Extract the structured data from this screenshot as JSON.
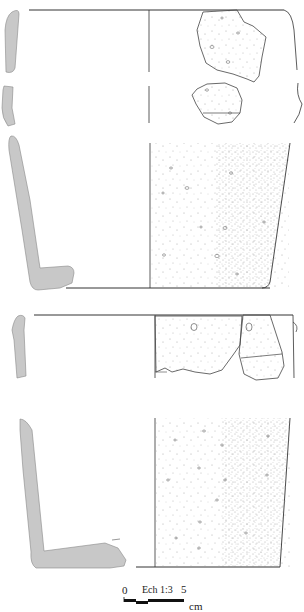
{
  "figure": {
    "type": "archaeological ceramic drawing",
    "vessels": [
      {
        "name": "vessel-1-rim",
        "parts": [
          "profile-section",
          "exterior-view-with-sherds"
        ]
      },
      {
        "name": "vessel-2",
        "parts": [
          "profile-section",
          "exterior-view-stippled"
        ]
      },
      {
        "name": "vessel-3-rim",
        "parts": [
          "profile-section",
          "exterior-view-with-sherds"
        ]
      },
      {
        "name": "vessel-4",
        "parts": [
          "profile-section",
          "exterior-view-stippled"
        ]
      }
    ],
    "colors": {
      "section_fill": "#c8c8c8",
      "line": "#333333",
      "stipple": "#888888"
    }
  },
  "scale_bar": {
    "start_label": "0",
    "title": "Ech 1:3",
    "end_label": "5",
    "unit": "cm"
  }
}
